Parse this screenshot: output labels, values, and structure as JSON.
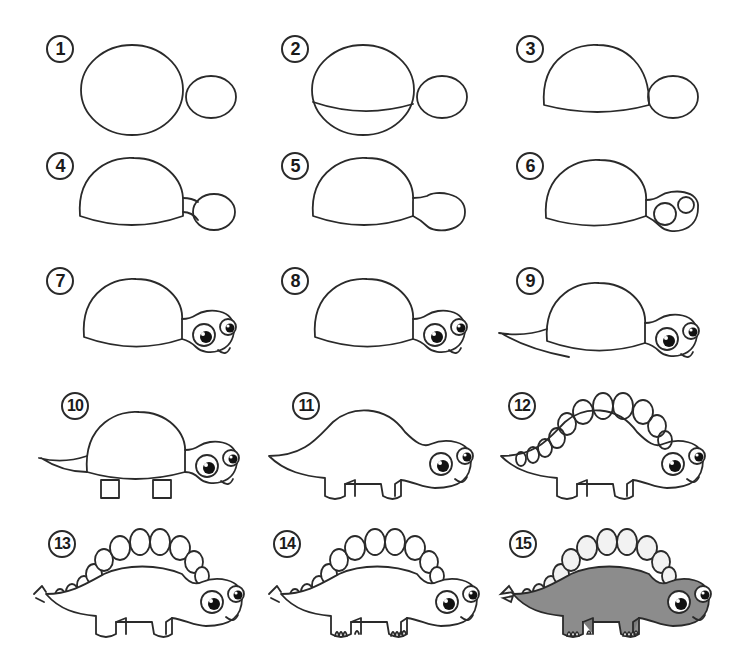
{
  "colors": {
    "line": "#2a2a2a",
    "background": "#ffffff",
    "body_fill": "#8c8c8c",
    "plate_fill": "#f2f2f2"
  },
  "steps": [
    {
      "number": "1",
      "description": "Draw a large oval and a small oval"
    },
    {
      "number": "2",
      "description": "Draw a curved line across the lower part of the large oval"
    },
    {
      "number": "3",
      "description": "Erase the bottom of the large oval to form a dome"
    },
    {
      "number": "4",
      "description": "Connect the head to the body with a neck"
    },
    {
      "number": "5",
      "description": "Erase extra lines between the neck and head"
    },
    {
      "number": "6",
      "description": "Draw two circles for the eyes"
    },
    {
      "number": "7",
      "description": "Add pupils, highlights and a smile"
    },
    {
      "number": "8",
      "description": "Clean up the head outline"
    },
    {
      "number": "9",
      "description": "Draw a pointed tail"
    },
    {
      "number": "10",
      "description": "Draw four legs"
    },
    {
      "number": "11",
      "description": "Reshape the body into a dinosaur back"
    },
    {
      "number": "12",
      "description": "Draw the back plates along the spine"
    },
    {
      "number": "13",
      "description": "Erase overlapping lines and add tail spikes"
    },
    {
      "number": "14",
      "description": "Draw toes on the feet"
    },
    {
      "number": "15",
      "description": "Color the dinosaur gray with light plates"
    }
  ]
}
